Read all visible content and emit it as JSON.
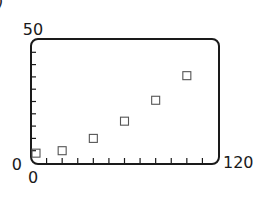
{
  "figure": {
    "corner_glyph": ")"
  },
  "chart_data": {
    "type": "scatter",
    "title": "",
    "xlabel": "",
    "ylabel": "",
    "xlim": [
      0,
      120
    ],
    "ylim": [
      0,
      50
    ],
    "x_tick_labels": {
      "min": "0",
      "max": "120"
    },
    "y_tick_labels": {
      "min": "0",
      "max": "50"
    },
    "x_minor_tick_step": 10,
    "y_minor_tick_step": 5,
    "grid": false,
    "legend": null,
    "marker": "open-square",
    "series": [
      {
        "name": "data",
        "points": [
          {
            "x": 0,
            "y": 4
          },
          {
            "x": 20,
            "y": 5
          },
          {
            "x": 40,
            "y": 10
          },
          {
            "x": 60,
            "y": 17
          },
          {
            "x": 80,
            "y": 25.5
          },
          {
            "x": 100,
            "y": 35.5
          }
        ]
      }
    ]
  },
  "colors": {
    "frame": "#1a1a1a",
    "marker": "#555555",
    "text": "#1a1a1a"
  }
}
